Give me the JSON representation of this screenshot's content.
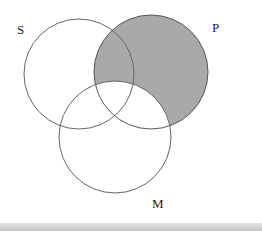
{
  "diagram": {
    "type": "venn-3",
    "labels": {
      "S": "S",
      "P": "P",
      "M": "M"
    },
    "circles": [
      {
        "name": "S",
        "cx": 79,
        "cy": 74,
        "r": 55
      },
      {
        "name": "P",
        "cx": 151,
        "cy": 72,
        "r": 57
      },
      {
        "name": "M",
        "cx": 115,
        "cy": 137,
        "r": 56
      }
    ],
    "shaded_region": "P minus M",
    "colors": {
      "shade": "#a9a9a9",
      "stroke": "#555555",
      "background": "#ffffff"
    }
  }
}
